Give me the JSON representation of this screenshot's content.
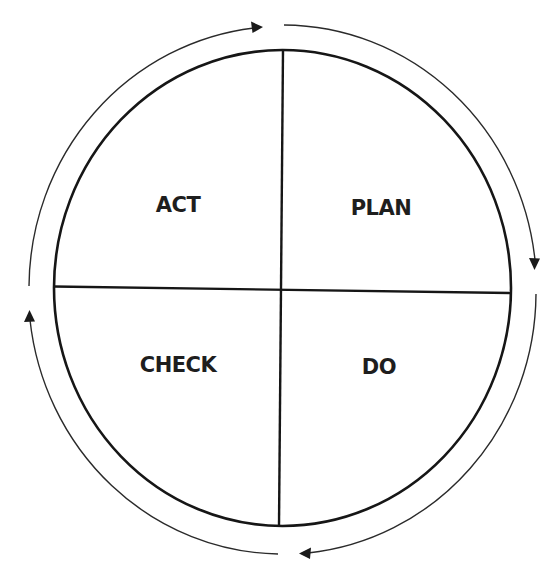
{
  "diagram": {
    "type": "PDCA cycle",
    "quadrants": [
      {
        "position": "top-left",
        "label": "ACT"
      },
      {
        "position": "top-right",
        "label": "PLAN"
      },
      {
        "position": "bottom-right",
        "label": "DO"
      },
      {
        "position": "bottom-left",
        "label": "CHECK"
      }
    ],
    "cycle_direction": "clockwise",
    "arrows": [
      {
        "from": "left",
        "to": "top",
        "icon": "arrow-right-icon"
      },
      {
        "from": "top",
        "to": "right",
        "icon": "arrow-down-icon"
      },
      {
        "from": "right",
        "to": "bottom",
        "icon": "arrow-left-icon"
      },
      {
        "from": "bottom",
        "to": "left",
        "icon": "arrow-up-icon"
      }
    ],
    "colors": {
      "stroke": "#161616",
      "text": "#1e1e1e",
      "background": "#ffffff"
    }
  }
}
